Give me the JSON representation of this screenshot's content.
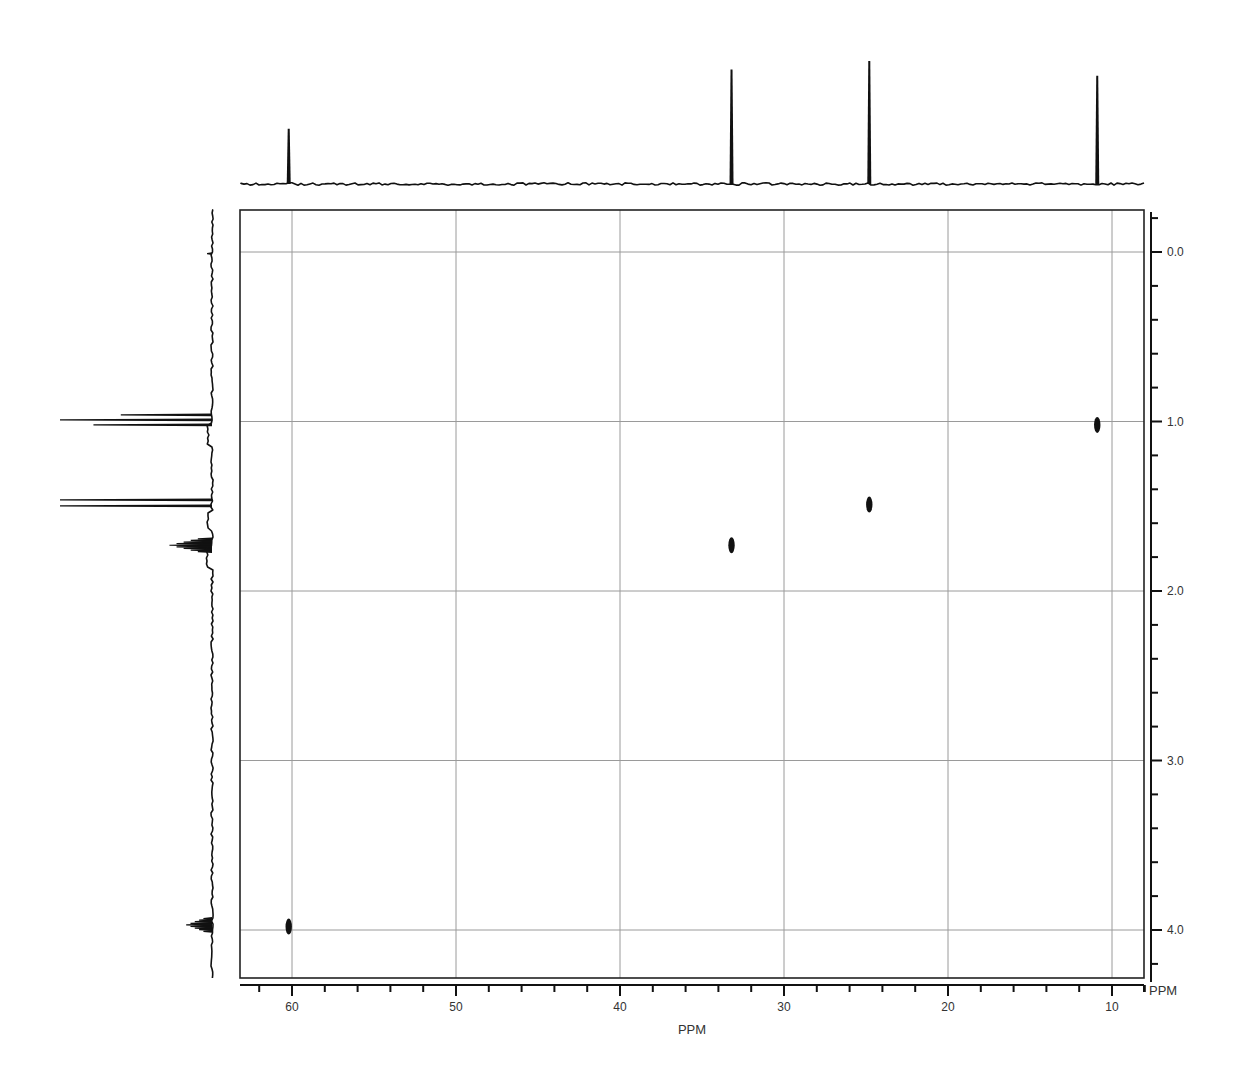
{
  "chart_data": {
    "type": "scatter",
    "xlabel": "PPM",
    "ylabel": "PPM",
    "x_axis": {
      "label": "PPM",
      "range": [
        63.2,
        7.8
      ],
      "reversed": true,
      "major_ticks": [
        60,
        50,
        40,
        30,
        20,
        10
      ],
      "tick_labels": [
        "60",
        "50",
        "40",
        "30",
        "20",
        "10"
      ],
      "minor_step": 2
    },
    "y_axis": {
      "label": "PPM",
      "range": [
        -0.25,
        4.3
      ],
      "reversed": true,
      "position": "right",
      "major_ticks": [
        0.0,
        1.0,
        2.0,
        3.0,
        4.0
      ],
      "tick_labels": [
        "0.0",
        "1.0",
        "2.0",
        "3.0",
        "4.0"
      ],
      "minor_step": 0.2
    },
    "grid": true,
    "cross_peaks": [
      {
        "x": 60.2,
        "y": 3.98,
        "label": "C1"
      },
      {
        "x": 33.2,
        "y": 1.73,
        "label": "C2"
      },
      {
        "x": 24.8,
        "y": 1.49,
        "label": "C3"
      },
      {
        "x": 10.9,
        "y": 1.02,
        "label": "C4"
      }
    ],
    "top_projection": {
      "nucleus": "13C",
      "peaks": [
        {
          "ppm": 60.2,
          "relative_height": 0.45
        },
        {
          "ppm": 33.2,
          "relative_height": 0.93
        },
        {
          "ppm": 24.8,
          "relative_height": 1.0
        },
        {
          "ppm": 10.9,
          "relative_height": 0.88
        }
      ]
    },
    "left_projection": {
      "nucleus": "1H",
      "peaks": [
        {
          "ppm": 0.01,
          "relative_height": 0.03,
          "multiplicity": "s"
        },
        {
          "ppm": 0.99,
          "relative_height": 1.0,
          "multiplicity": "t"
        },
        {
          "ppm": 1.48,
          "relative_height": 1.0,
          "multiplicity": "d"
        },
        {
          "ppm": 1.73,
          "relative_height": 0.28,
          "multiplicity": "m"
        },
        {
          "ppm": 3.97,
          "relative_height": 0.17,
          "multiplicity": "m"
        }
      ]
    }
  },
  "axes": {
    "x_unit": "PPM",
    "y_unit": "PPM"
  },
  "colors": {
    "trace": "#111111",
    "grid": "#9a9a9a",
    "background": "#ffffff"
  }
}
